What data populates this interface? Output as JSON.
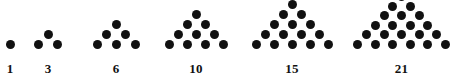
{
  "figure": {
    "background_color": "#ffffff",
    "dot_color": "#111111",
    "label_color": "#111111"
  },
  "chart_data": {
    "type": "scatter",
    "title": "",
    "subtitle": "",
    "xlabel": "",
    "ylabel": "",
    "grid": false,
    "legend": null,
    "categories": [
      "1",
      "3",
      "6",
      "10",
      "15",
      "21"
    ],
    "values": [
      1,
      3,
      6,
      10,
      15,
      21
    ],
    "series": [
      {
        "name": "triangular numbers",
        "values": [
          1,
          3,
          6,
          10,
          15,
          21
        ]
      },
      {
        "name": "rows per figure",
        "values": [
          1,
          2,
          3,
          4,
          5,
          6
        ]
      }
    ],
    "annotations": [
      "1",
      "3",
      "6",
      "10",
      "15",
      "21"
    ]
  },
  "figures": [
    {
      "id": "triangle-1",
      "label": "1",
      "rows": 1,
      "total_dots": 1,
      "row_counts": [
        1
      ],
      "left": 0,
      "width": 20,
      "dot_spacing_x": 18,
      "dot_spacing_y": 10,
      "baseline_y": 44
    },
    {
      "id": "triangle-3",
      "label": "3",
      "rows": 2,
      "total_dots": 3,
      "row_counts": [
        1,
        2
      ],
      "left": 29,
      "width": 38,
      "dot_spacing_x": 19,
      "dot_spacing_y": 10,
      "baseline_y": 44
    },
    {
      "id": "triangle-6",
      "label": "6",
      "rows": 3,
      "total_dots": 6,
      "row_counts": [
        1,
        2,
        3
      ],
      "left": 88,
      "width": 56,
      "dot_spacing_x": 19,
      "dot_spacing_y": 10,
      "baseline_y": 44
    },
    {
      "id": "triangle-10",
      "label": "10",
      "rows": 4,
      "total_dots": 10,
      "row_counts": [
        1,
        2,
        3,
        4
      ],
      "left": 160,
      "width": 72,
      "dot_spacing_x": 18,
      "dot_spacing_y": 10,
      "baseline_y": 44
    },
    {
      "id": "triangle-15",
      "label": "15",
      "rows": 5,
      "total_dots": 15,
      "row_counts": [
        1,
        2,
        3,
        4,
        5
      ],
      "left": 247,
      "width": 90,
      "dot_spacing_x": 18,
      "dot_spacing_y": 10,
      "baseline_y": 44
    },
    {
      "id": "triangle-21",
      "label": "21",
      "rows": 6,
      "total_dots": 21,
      "row_counts": [
        1,
        2,
        3,
        4,
        5,
        6
      ],
      "left": 351,
      "width": 101,
      "dot_spacing_x": 17.5,
      "dot_spacing_y": 9.5,
      "baseline_y": 44
    }
  ]
}
